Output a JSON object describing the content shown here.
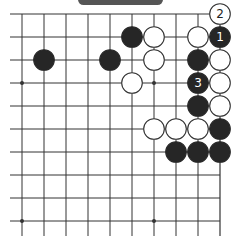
{
  "diagram": {
    "type": "go-board-fragment",
    "visible_columns": 10,
    "visible_rows": 10,
    "edges": [
      "top",
      "right"
    ],
    "colors": {
      "line": "#333333",
      "black_stone": "#262626",
      "white_stone": "#ffffff",
      "stone_outline": "#333333",
      "banner": "#555555"
    },
    "star_points": [
      {
        "col": 0,
        "row": 3
      },
      {
        "col": 6,
        "row": 3
      },
      {
        "col": 0,
        "row": 9
      },
      {
        "col": 6,
        "row": 9
      }
    ],
    "stones": [
      {
        "col": 9,
        "row": 0,
        "color": "white",
        "label": "2"
      },
      {
        "col": 5,
        "row": 1,
        "color": "black",
        "label": ""
      },
      {
        "col": 6,
        "row": 1,
        "color": "white",
        "label": ""
      },
      {
        "col": 8,
        "row": 1,
        "color": "white",
        "label": ""
      },
      {
        "col": 9,
        "row": 1,
        "color": "black",
        "label": "1"
      },
      {
        "col": 1,
        "row": 2,
        "color": "black",
        "label": ""
      },
      {
        "col": 4,
        "row": 2,
        "color": "black",
        "label": ""
      },
      {
        "col": 6,
        "row": 2,
        "color": "white",
        "label": ""
      },
      {
        "col": 8,
        "row": 2,
        "color": "black",
        "label": ""
      },
      {
        "col": 9,
        "row": 2,
        "color": "white",
        "label": ""
      },
      {
        "col": 5,
        "row": 3,
        "color": "white",
        "label": ""
      },
      {
        "col": 8,
        "row": 3,
        "color": "black",
        "label": "3"
      },
      {
        "col": 9,
        "row": 3,
        "color": "white",
        "label": ""
      },
      {
        "col": 8,
        "row": 4,
        "color": "black",
        "label": ""
      },
      {
        "col": 9,
        "row": 4,
        "color": "white",
        "label": ""
      },
      {
        "col": 6,
        "row": 5,
        "color": "white",
        "label": ""
      },
      {
        "col": 7,
        "row": 5,
        "color": "white",
        "label": ""
      },
      {
        "col": 8,
        "row": 5,
        "color": "white",
        "label": ""
      },
      {
        "col": 9,
        "row": 5,
        "color": "black",
        "label": ""
      },
      {
        "col": 7,
        "row": 6,
        "color": "black",
        "label": ""
      },
      {
        "col": 8,
        "row": 6,
        "color": "black",
        "label": ""
      },
      {
        "col": 9,
        "row": 6,
        "color": "black",
        "label": ""
      }
    ]
  }
}
